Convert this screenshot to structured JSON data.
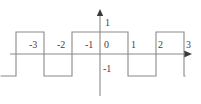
{
  "figure": {
    "width": 201,
    "height": 104,
    "background": "#ffffff",
    "stroke_color": "#8a8a8a",
    "text_color": "#3f3f3f"
  },
  "axes": {
    "x_axis_name": "horizontal-axis",
    "y_axis_name": "vertical-axis",
    "x_axis_arrow": "arrow-right",
    "y_axis_arrow": "arrow-up",
    "origin_px": {
      "x": 100,
      "y": 54
    },
    "unit_px": {
      "x": 28,
      "y": 22
    }
  },
  "labels": {
    "x_ticks": [
      {
        "text": "-3",
        "value": -3,
        "px_x": 31,
        "px_y": 44
      },
      {
        "text": "-2",
        "value": -2,
        "px_x": 59,
        "px_y": 44
      },
      {
        "text": "-1",
        "value": -1,
        "px_x": 87,
        "px_y": 44
      },
      {
        "text": "0",
        "value": 0,
        "px_x": 104,
        "px_y": 44
      },
      {
        "text": "1",
        "value": 1,
        "px_x": 131,
        "px_y": 44
      },
      {
        "text": "2",
        "value": 2,
        "px_x": 158,
        "px_y": 44
      },
      {
        "text": "3",
        "value": 3,
        "px_x": 186,
        "px_y": 44
      }
    ],
    "y_ticks": [
      {
        "text": "1",
        "value": 1,
        "px_x": 104,
        "px_y": 22
      },
      {
        "text": "-1",
        "value": -1,
        "px_x": 102,
        "px_y": 66
      }
    ]
  },
  "chart_data": {
    "type": "line",
    "title": "",
    "xlabel": "",
    "ylabel": "",
    "xlim": [
      -3.55,
      3.05
    ],
    "ylim": [
      -1.9,
      1.9
    ],
    "grid": false,
    "legend": null,
    "x_tick_values": [
      -3,
      -2,
      -1,
      0,
      1,
      2,
      3
    ],
    "x_tick_labels": [
      "-3",
      "-2",
      "-1",
      "0",
      "1",
      "2",
      "3"
    ],
    "y_tick_values": [
      1,
      -1
    ],
    "y_tick_labels": [
      "1",
      "-1"
    ],
    "series": [
      {
        "name": "square-wave",
        "color": "#8a8a8a",
        "x": [
          -3.55,
          -3,
          -3,
          -2,
          -2,
          -1,
          -1,
          1,
          1,
          2,
          2,
          3,
          3,
          3.05
        ],
        "y": [
          -1,
          -1,
          1,
          1,
          -1,
          -1,
          1,
          1,
          -1,
          -1,
          1,
          1,
          -1,
          -1
        ]
      }
    ],
    "high_intervals": [
      [
        -3,
        -2
      ],
      [
        -1,
        1
      ],
      [
        2,
        3
      ]
    ],
    "low_intervals": [
      [
        -3.55,
        -3
      ],
      [
        -2,
        -1
      ],
      [
        1,
        2
      ],
      [
        3,
        3.05
      ]
    ],
    "amplitude": 1,
    "period": 2
  }
}
